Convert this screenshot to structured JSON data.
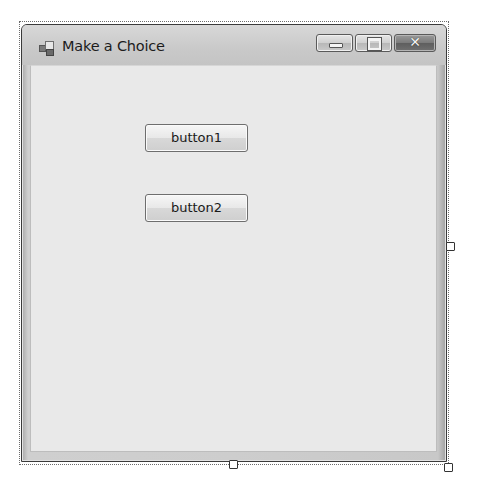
{
  "window": {
    "title": "Make a Choice",
    "icon": "form-icon",
    "caption_buttons": {
      "minimize": {
        "icon": "minimize-icon",
        "glyph": ""
      },
      "maximize": {
        "icon": "maximize-icon",
        "glyph": ""
      },
      "close": {
        "icon": "close-icon",
        "glyph": "✕"
      }
    }
  },
  "form": {
    "buttons": [
      {
        "label": "button1"
      },
      {
        "label": "button2"
      }
    ]
  },
  "designer": {
    "selection_handles": [
      "right-middle",
      "bottom-middle",
      "bottom-right"
    ]
  }
}
